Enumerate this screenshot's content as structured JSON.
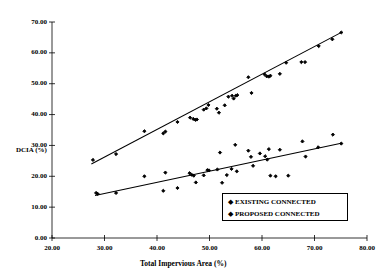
{
  "chart_data": {
    "type": "scatter",
    "title": "",
    "xlabel": "Total Impervious Area (%)",
    "ylabel": "DCIA (%)",
    "xlim": [
      20.0,
      80.0
    ],
    "ylim": [
      0.0,
      70.0
    ],
    "grid": false,
    "legend_position": "inside-lower-right",
    "xticks": [
      "20.00",
      "30.00",
      "40.00",
      "50.00",
      "60.00",
      "70.00",
      "80.00"
    ],
    "yticks": [
      "0.00",
      "10.00",
      "20.00",
      "30.00",
      "40.00",
      "50.00",
      "60.00",
      "70.00"
    ],
    "xtick_values": [
      20,
      30,
      40,
      50,
      60,
      70,
      80
    ],
    "ytick_values": [
      0,
      10,
      20,
      30,
      40,
      50,
      60,
      70
    ],
    "series": [
      {
        "name": "EXISTING CONNECTED",
        "marker": "diamond",
        "color": "#000000",
        "points": [
          [
            27.8,
            25.3
          ],
          [
            32.2,
            27.2
          ],
          [
            37.6,
            34.6
          ],
          [
            41.2,
            33.9
          ],
          [
            41.6,
            34.5
          ],
          [
            43.9,
            37.6
          ],
          [
            46.3,
            39.0
          ],
          [
            46.9,
            38.6
          ],
          [
            47.3,
            38.3
          ],
          [
            47.6,
            38.4
          ],
          [
            48.9,
            41.6
          ],
          [
            49.4,
            42.0
          ],
          [
            49.8,
            43.1
          ],
          [
            51.4,
            41.9
          ],
          [
            51.8,
            40.6
          ],
          [
            52.9,
            43.0
          ],
          [
            53.6,
            45.8
          ],
          [
            54.3,
            46.1
          ],
          [
            54.6,
            45.2
          ],
          [
            55.0,
            46.1
          ],
          [
            55.3,
            46.3
          ],
          [
            57.4,
            52.1
          ],
          [
            58.0,
            47.0
          ],
          [
            60.5,
            53.0
          ],
          [
            60.9,
            52.4
          ],
          [
            61.3,
            52.3
          ],
          [
            61.6,
            52.6
          ],
          [
            63.4,
            53.2
          ],
          [
            64.6,
            56.8
          ],
          [
            67.5,
            57.0
          ],
          [
            68.2,
            57.0
          ],
          [
            70.8,
            62.2
          ],
          [
            73.4,
            64.4
          ],
          [
            75.1,
            66.6
          ]
        ],
        "trendline": {
          "x0": 27.5,
          "y0": 24.0,
          "x1": 75.3,
          "y1": 66.8
        }
      },
      {
        "name": "PROPOSED CONNECTED",
        "marker": "diamond",
        "color": "#000000",
        "points": [
          [
            28.4,
            14.6
          ],
          [
            28.7,
            14.3
          ],
          [
            32.2,
            14.6
          ],
          [
            37.6,
            20.0
          ],
          [
            41.2,
            15.3
          ],
          [
            41.6,
            21.2
          ],
          [
            43.9,
            16.2
          ],
          [
            46.2,
            21.0
          ],
          [
            46.6,
            20.5
          ],
          [
            47.0,
            20.2
          ],
          [
            47.4,
            18.0
          ],
          [
            48.9,
            20.3
          ],
          [
            49.6,
            22.0
          ],
          [
            49.9,
            21.9
          ],
          [
            51.5,
            22.2
          ],
          [
            52.0,
            27.7
          ],
          [
            52.4,
            17.9
          ],
          [
            53.3,
            20.4
          ],
          [
            54.2,
            22.4
          ],
          [
            54.9,
            30.2
          ],
          [
            55.2,
            21.6
          ],
          [
            57.4,
            28.3
          ],
          [
            57.9,
            26.3
          ],
          [
            58.3,
            23.4
          ],
          [
            59.6,
            27.4
          ],
          [
            60.6,
            26.5
          ],
          [
            61.0,
            25.4
          ],
          [
            61.3,
            28.8
          ],
          [
            61.6,
            20.2
          ],
          [
            62.6,
            20.0
          ],
          [
            63.4,
            28.6
          ],
          [
            65.0,
            20.2
          ],
          [
            67.7,
            31.3
          ],
          [
            68.3,
            26.4
          ],
          [
            70.7,
            29.4
          ],
          [
            73.5,
            33.5
          ],
          [
            75.1,
            30.6
          ]
        ],
        "trendline": {
          "x0": 28.2,
          "y0": 13.8,
          "x1": 75.3,
          "y1": 30.8
        }
      }
    ]
  },
  "legend": {
    "items": [
      {
        "marker": "◆",
        "label": "EXISTING CONNECTED"
      },
      {
        "marker": "◆",
        "label": "PROPOSED CONNECTED"
      }
    ]
  }
}
